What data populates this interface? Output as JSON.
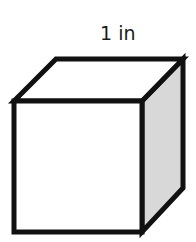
{
  "diagram": {
    "type": "cube",
    "edge_label": "1 in",
    "colors": {
      "stroke": "#111111",
      "front_face": "#ffffff",
      "top_face": "#ffffff",
      "side_face": "#d8d8d8"
    }
  }
}
